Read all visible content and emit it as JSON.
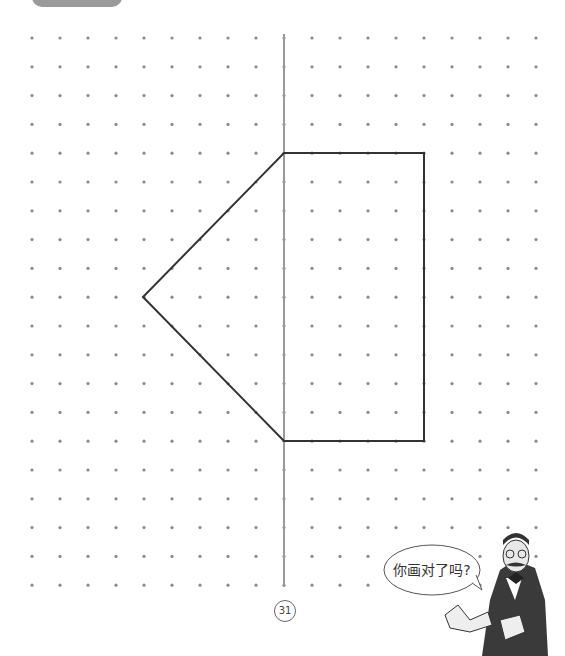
{
  "page": {
    "number": "31"
  },
  "speech_bubble": {
    "text": "你画对了吗?"
  },
  "grid": {
    "x0": 32,
    "dx": 28,
    "cols": 19,
    "y0": 38,
    "dy": 28.8,
    "rows": 20,
    "dot_color": "#8a8a8a"
  },
  "axis": {
    "x": 284,
    "y1": 34,
    "y2": 587,
    "color": "#9a9a9a"
  },
  "figure": {
    "color": "#333333",
    "points": [
      [
        284,
        153
      ],
      [
        424,
        153
      ],
      [
        424,
        441
      ],
      [
        284,
        441
      ],
      [
        143,
        297
      ]
    ]
  }
}
